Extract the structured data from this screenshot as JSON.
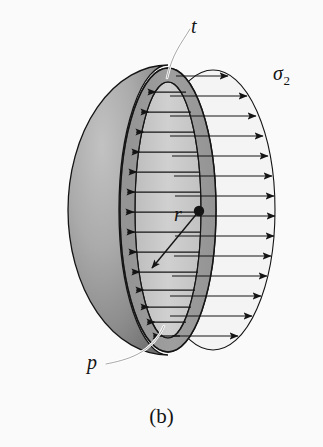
{
  "figure": {
    "caption": "(b)",
    "background_color": "#fafafa",
    "line_color": "#141414",
    "labels": {
      "thickness": "t",
      "pressure": "p",
      "radius": "r",
      "stress": "σ",
      "stress_subscript": "2"
    },
    "colors": {
      "sphere_light": "#b4b4b4",
      "sphere_dark": "#6e6e6e",
      "rim_band": "#8f8f8f",
      "inner_face": "#c9c9c9",
      "cut_face": "#a8a8a8",
      "envelope_fill": "#f2f2f2",
      "leader_white": "#ffffff"
    },
    "geometry": {
      "sphere_center_x": 118,
      "sphere_center_y": 210,
      "sphere_radius_x": 100,
      "sphere_radius_y": 145,
      "rim_center_x": 168,
      "rim_outer_rx": 48,
      "rim_outer_ry": 142,
      "rim_inner_rx": 33,
      "rim_inner_ry": 128,
      "envelope_center_x": 213,
      "envelope_rx": 62,
      "envelope_ry": 140,
      "dot_x": 199,
      "dot_y": 211,
      "dot_radius": 5
    },
    "pressure_arrows": {
      "count": 14,
      "direction": "left",
      "description": "internal pressure p acting outward on the inner shell wall"
    },
    "stress_arrows": {
      "count": 14,
      "direction": "right",
      "description": "membrane stress sigma-2 distributed over the cut cross-section"
    }
  }
}
